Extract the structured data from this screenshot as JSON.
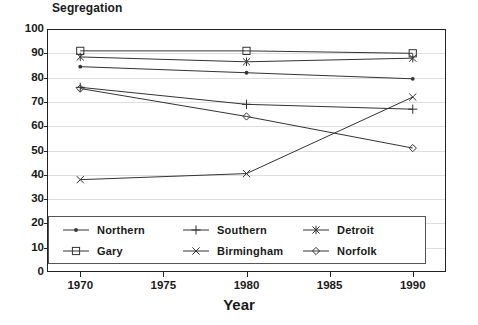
{
  "chart_data": {
    "type": "line",
    "title": "Segregation",
    "xlabel": "Year",
    "ylabel": "",
    "x": [
      1970,
      1980,
      1990
    ],
    "xlim": [
      1968,
      1992
    ],
    "ylim": [
      0,
      100
    ],
    "xticks": [
      1970,
      1975,
      1980,
      1985,
      1990
    ],
    "yticks": [
      0,
      10,
      20,
      30,
      40,
      50,
      60,
      70,
      80,
      90,
      100
    ],
    "grid": true,
    "legend_position": "inside-bottom-left",
    "series": [
      {
        "name": "Northern",
        "marker": "filled-circle",
        "values": [
          84.5,
          82.0,
          79.5
        ]
      },
      {
        "name": "Southern",
        "marker": "plus",
        "values": [
          76.0,
          69.0,
          67.0
        ]
      },
      {
        "name": "Detroit",
        "marker": "asterisk",
        "values": [
          88.5,
          86.5,
          88.0
        ]
      },
      {
        "name": "Gary",
        "marker": "square",
        "values": [
          91.0,
          91.0,
          90.0
        ]
      },
      {
        "name": "Birmingham",
        "marker": "cross",
        "values": [
          38.0,
          40.5,
          72.0
        ]
      },
      {
        "name": "Norfolk",
        "marker": "diamond",
        "values": [
          75.5,
          64.0,
          51.0
        ]
      }
    ]
  },
  "axis": {
    "y_tick_labels": [
      "100",
      "90",
      "80",
      "70",
      "60",
      "50",
      "40",
      "30",
      "20",
      "10",
      "0"
    ],
    "x_tick_labels": [
      "1970",
      "1975",
      "1980",
      "1985",
      "1990"
    ]
  },
  "legend": {
    "items": [
      {
        "label": "Northern",
        "marker": "filled-circle"
      },
      {
        "label": "Southern",
        "marker": "plus"
      },
      {
        "label": "Detroit",
        "marker": "asterisk"
      },
      {
        "label": "Gary",
        "marker": "square"
      },
      {
        "label": "Birmingham",
        "marker": "cross"
      },
      {
        "label": "Norfolk",
        "marker": "diamond"
      }
    ],
    "order": [
      0,
      1,
      2,
      3,
      4,
      5
    ]
  },
  "colors": {
    "line": "#333333",
    "grid": "#dedede",
    "frame": "#222222",
    "background": "#ffffff"
  }
}
